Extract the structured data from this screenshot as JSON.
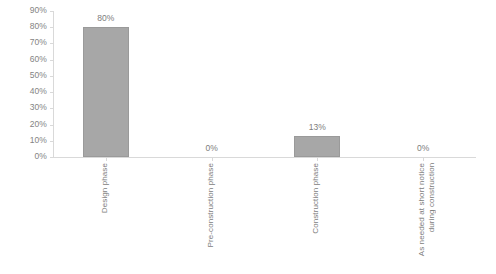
{
  "chart_data": {
    "type": "bar",
    "title": "",
    "xlabel": "",
    "ylabel": "",
    "ylim": [
      0,
      90
    ],
    "grid": false,
    "legend": false,
    "y_tick_labels": [
      "90%",
      "80%",
      "70%",
      "60%",
      "50%",
      "40%",
      "30%",
      "20%",
      "10%",
      "0%"
    ],
    "y_tick_values": [
      90,
      80,
      70,
      60,
      50,
      40,
      30,
      20,
      10,
      0
    ],
    "categories": [
      "Design phase",
      "Pre-construction phase",
      "Construction phase",
      "As needed at short notice during construction"
    ],
    "values": [
      80,
      0,
      13,
      0
    ],
    "data_labels": [
      "80%",
      "0%",
      "13%",
      "0%"
    ],
    "bar_color": "#a7a7a7",
    "bar_border_color": "#9a9a9a",
    "axis_color": "#d9d9d9",
    "text_color": "#7d7d7d"
  },
  "category_label_lines": [
    [
      "Design phase"
    ],
    [
      "Pre-construction phase"
    ],
    [
      "Construction phase"
    ],
    [
      "As needed at short notice",
      "during construction"
    ]
  ]
}
